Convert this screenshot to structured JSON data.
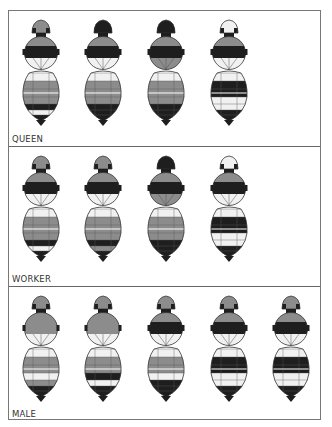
{
  "colors": {
    "black": "#1e1e1e",
    "gray": "#8c8c8c",
    "light": "#f1f1f1",
    "outline": "#333333"
  },
  "panels": [
    {
      "label": "QUEEN",
      "bees": [
        {
          "head": "gray",
          "thorax_top": "gray",
          "thorax_band": "black",
          "thorax_low": "light",
          "abdomen": [
            "light",
            "gray",
            "gray",
            "gray",
            "black",
            "light",
            "black"
          ]
        },
        {
          "head": "black",
          "thorax_top": "gray",
          "thorax_band": "black",
          "thorax_low": "light",
          "abdomen": [
            "light",
            "gray",
            "gray",
            "gray",
            "black",
            "black",
            "black"
          ]
        },
        {
          "head": "black",
          "thorax_top": "gray",
          "thorax_band": "black",
          "thorax_low": "gray",
          "abdomen": [
            "light",
            "gray",
            "gray",
            "gray",
            "black",
            "black",
            "black"
          ]
        },
        {
          "head": "light",
          "thorax_top": "gray",
          "thorax_band": "black",
          "thorax_low": "light",
          "abdomen": [
            "light",
            "black",
            "black",
            "light",
            "light",
            "black",
            "black"
          ]
        }
      ]
    },
    {
      "label": "WORKER",
      "bees": [
        {
          "head": "gray",
          "thorax_top": "gray",
          "thorax_band": "black",
          "thorax_low": "light",
          "abdomen": [
            "light",
            "gray",
            "gray",
            "gray",
            "black",
            "light",
            "black"
          ]
        },
        {
          "head": "gray",
          "thorax_top": "gray",
          "thorax_band": "black",
          "thorax_low": "light",
          "abdomen": [
            "light",
            "gray",
            "gray",
            "gray",
            "black",
            "gray",
            "black"
          ]
        },
        {
          "head": "black",
          "thorax_top": "gray",
          "thorax_band": "black",
          "thorax_low": "gray",
          "abdomen": [
            "light",
            "gray",
            "gray",
            "gray",
            "black",
            "black",
            "black"
          ]
        },
        {
          "head": "light",
          "thorax_top": "gray",
          "thorax_band": "black",
          "thorax_low": "light",
          "abdomen": [
            "light",
            "black",
            "black",
            "light",
            "light",
            "black",
            "black"
          ]
        }
      ]
    },
    {
      "label": "MALE",
      "bees": [
        {
          "head": "gray",
          "thorax_top": "gray",
          "thorax_band": "gray",
          "thorax_low": "light",
          "abdomen": [
            "light",
            "gray",
            "gray",
            "light",
            "gray",
            "black",
            "black"
          ]
        },
        {
          "head": "gray",
          "thorax_top": "gray",
          "thorax_band": "gray",
          "thorax_low": "light",
          "abdomen": [
            "light",
            "gray",
            "gray",
            "black",
            "light",
            "black",
            "black"
          ]
        },
        {
          "head": "gray",
          "thorax_top": "gray",
          "thorax_band": "black",
          "thorax_low": "light",
          "abdomen": [
            "light",
            "gray",
            "gray",
            "light",
            "black",
            "black",
            "black"
          ]
        },
        {
          "head": "gray",
          "thorax_top": "gray",
          "thorax_band": "black",
          "thorax_low": "light",
          "abdomen": [
            "light",
            "black",
            "black",
            "light",
            "light",
            "black",
            "black"
          ]
        },
        {
          "head": "gray",
          "thorax_top": "gray",
          "thorax_band": "black",
          "thorax_low": "light",
          "abdomen": [
            "light",
            "black",
            "black",
            "light",
            "light",
            "black",
            "black"
          ]
        }
      ]
    }
  ],
  "layout": {
    "panel_tops": [
      0,
      136,
      276
    ],
    "panel_heights": [
      136,
      140,
      134
    ],
    "bee_centers_x": [
      32,
      94,
      157,
      220,
      282
    ]
  }
}
